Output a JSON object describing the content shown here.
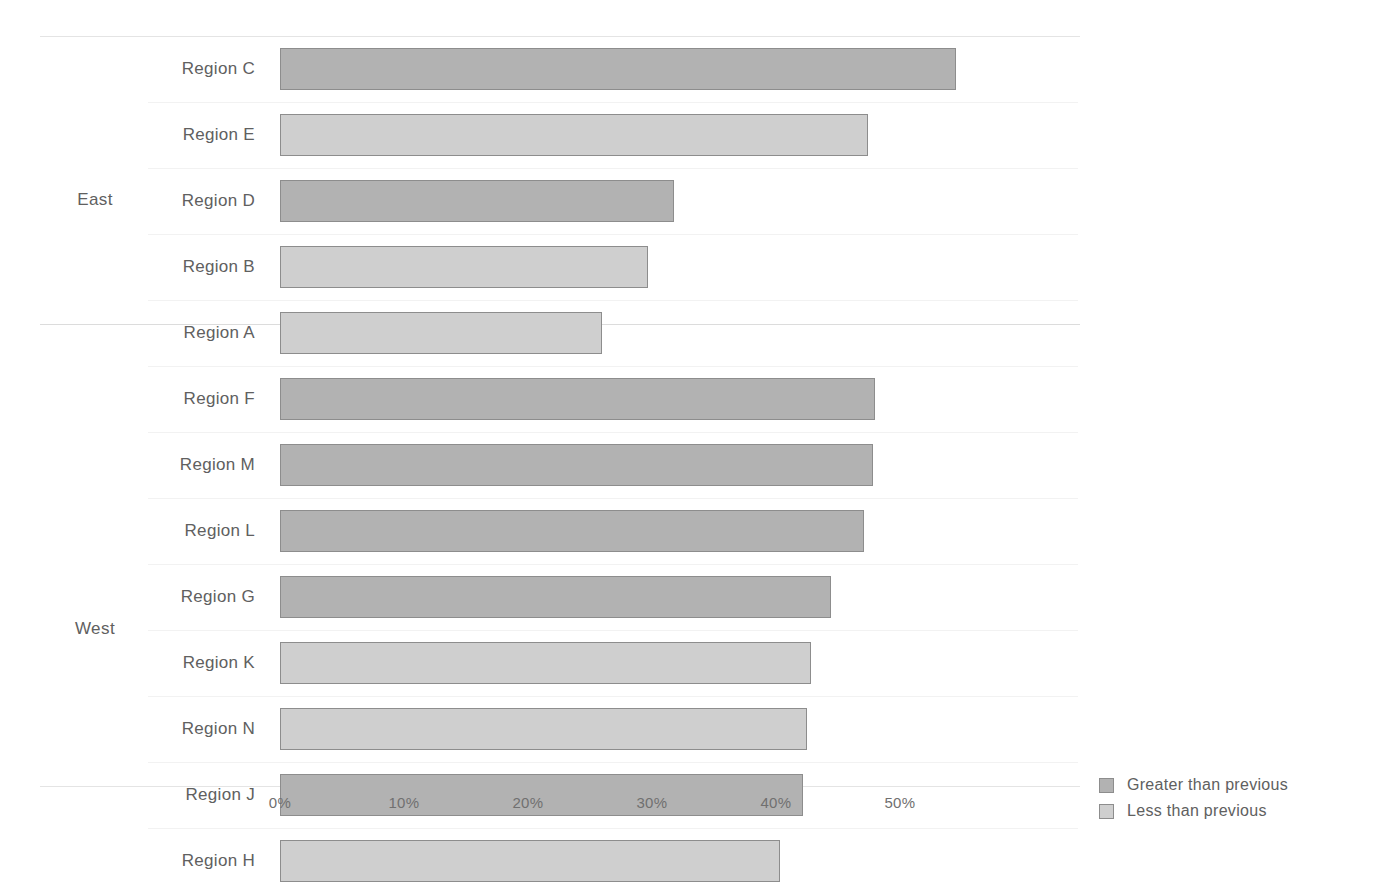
{
  "chart_data": {
    "type": "bar",
    "orientation": "horizontal",
    "title": "",
    "xlabel": "",
    "ylabel": "",
    "xlim": [
      0,
      55
    ],
    "xticks": [
      "0%",
      "10%",
      "20%",
      "30%",
      "40%",
      "50%"
    ],
    "xtick_values": [
      0,
      10,
      20,
      30,
      40,
      50
    ],
    "grid": true,
    "legend_position": "bottom-right",
    "legend": [
      {
        "key": "greater",
        "label": "Greater than previous",
        "color": "#b2b2b2"
      },
      {
        "key": "less",
        "label": "Less than previous",
        "color": "#cfcfcf"
      }
    ],
    "groups": [
      {
        "name": "East",
        "categories": [
          "Region C",
          "Region E",
          "Region D",
          "Region B",
          "Region A"
        ],
        "values": [
          54.5,
          47.4,
          31.8,
          29.7,
          26.0
        ],
        "series_keys": [
          "greater",
          "less",
          "greater",
          "less",
          "less"
        ]
      },
      {
        "name": "West",
        "categories": [
          "Region F",
          "Region M",
          "Region L",
          "Region G",
          "Region K",
          "Region N",
          "Region J",
          "Region H"
        ],
        "values": [
          48.0,
          47.8,
          47.1,
          44.4,
          42.8,
          42.5,
          42.2,
          40.3
        ],
        "series_keys": [
          "greater",
          "greater",
          "greater",
          "greater",
          "less",
          "less",
          "greater",
          "less"
        ]
      }
    ]
  },
  "axis": {
    "ticks": [
      {
        "label": "0%",
        "value": 0
      },
      {
        "label": "10%",
        "value": 10
      },
      {
        "label": "20%",
        "value": 20
      },
      {
        "label": "30%",
        "value": 30
      },
      {
        "label": "40%",
        "value": 40
      },
      {
        "label": "50%",
        "value": 50
      }
    ]
  },
  "groups": [
    {
      "label": "East"
    },
    {
      "label": "West"
    }
  ],
  "rows": [
    {
      "label": "Region C",
      "value": 54.5,
      "series": "greater",
      "group": "East"
    },
    {
      "label": "Region E",
      "value": 47.4,
      "series": "less",
      "group": "East"
    },
    {
      "label": "Region D",
      "value": 31.8,
      "series": "greater",
      "group": "East"
    },
    {
      "label": "Region B",
      "value": 29.7,
      "series": "less",
      "group": "East"
    },
    {
      "label": "Region A",
      "value": 26.0,
      "series": "less",
      "group": "East"
    },
    {
      "label": "Region F",
      "value": 48.0,
      "series": "greater",
      "group": "West"
    },
    {
      "label": "Region M",
      "value": 47.8,
      "series": "greater",
      "group": "West"
    },
    {
      "label": "Region L",
      "value": 47.1,
      "series": "greater",
      "group": "West"
    },
    {
      "label": "Region G",
      "value": 44.4,
      "series": "greater",
      "group": "West"
    },
    {
      "label": "Region K",
      "value": 42.8,
      "series": "less",
      "group": "West"
    },
    {
      "label": "Region N",
      "value": 42.5,
      "series": "less",
      "group": "West"
    },
    {
      "label": "Region J",
      "value": 42.2,
      "series": "greater",
      "group": "West"
    },
    {
      "label": "Region H",
      "value": 40.3,
      "series": "less",
      "group": "West"
    }
  ],
  "legend": {
    "items": [
      {
        "label": "Greater than previous",
        "series": "greater"
      },
      {
        "label": "Less than previous",
        "series": "less"
      }
    ]
  },
  "geometry": {
    "axis_origin_x": 280,
    "px_per_percent": 12.4,
    "first_row_top": 36,
    "row_pitch": 66,
    "group_gap_after_index": 4
  }
}
